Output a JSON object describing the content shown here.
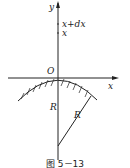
{
  "figure": {
    "caption": "图 5－13",
    "y_axis_label": "y",
    "x_axis_label": "x",
    "origin_label": "O",
    "marks": [
      {
        "label": "x+dx",
        "italic_parts": [
          "x",
          "x"
        ],
        "roman_part": "+d"
      },
      {
        "label": "x"
      }
    ],
    "radius_labels": [
      "R",
      "R"
    ],
    "colors": {
      "stroke": "#222222",
      "background": "#ffffff"
    }
  }
}
